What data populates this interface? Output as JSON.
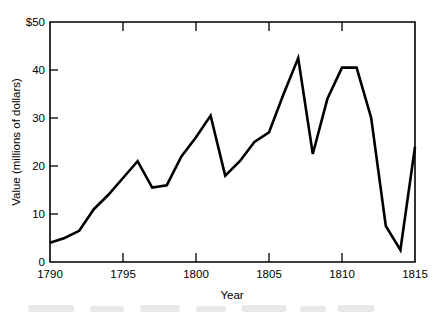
{
  "chart_data": {
    "type": "line",
    "title": "",
    "xlabel": "Year",
    "ylabel": "Value (millions of dollars)",
    "xlim": [
      1790,
      1815
    ],
    "ylim": [
      0,
      50
    ],
    "grid": false,
    "legend": null,
    "xticks": [
      "1790",
      "1795",
      "1800",
      "1805",
      "1810",
      "1815"
    ],
    "xtick_values": [
      1790,
      1795,
      1800,
      1805,
      1810,
      1815
    ],
    "yticks": [
      "0",
      "10",
      "20",
      "30",
      "40",
      "$50"
    ],
    "ytick_values": [
      0,
      10,
      20,
      30,
      40,
      50
    ],
    "series": [
      {
        "name": "Value",
        "x": [
          1790,
          1791,
          1792,
          1793,
          1794,
          1795,
          1796,
          1797,
          1798,
          1799,
          1800,
          1801,
          1802,
          1803,
          1804,
          1805,
          1806,
          1807,
          1808,
          1809,
          1810,
          1811,
          1812,
          1813,
          1814,
          1815
        ],
        "values": [
          4,
          5,
          6.5,
          11,
          14,
          17.5,
          21,
          15.5,
          16,
          22,
          26,
          30.5,
          18,
          21,
          25,
          27,
          35,
          42.5,
          22.5,
          34,
          40.5,
          40.5,
          30,
          7.5,
          2.5,
          24
        ]
      }
    ]
  },
  "axes": {
    "y_axis_label": "Value (millions of dollars)",
    "x_axis_label": "Year",
    "y_top_label": "$50",
    "x_first_label": "1790",
    "x_last_label": "1815"
  },
  "style": {
    "line_color": "#000000",
    "axis_color": "#000000",
    "background": "#ffffff",
    "line_width": "2.6"
  }
}
